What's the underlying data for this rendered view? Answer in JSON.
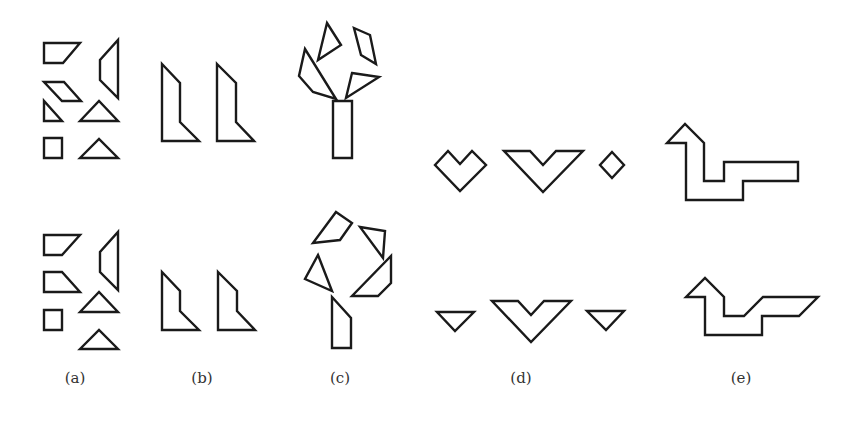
{
  "figure": {
    "stroke_color": "#1a1a1a",
    "background": "#ffffff",
    "panels": [
      {
        "id": "a",
        "label": "(a)",
        "label_x": 75,
        "description": "Loose tangram pieces (two sets)",
        "rows": {
          "top": [
            {
              "name": "trapezoid",
              "points": "44,43 80,43 63,63 44,63"
            },
            {
              "name": "right-trapezoid",
              "points": "118,40 118,98 100,80 100,60"
            },
            {
              "name": "parallelogram",
              "points": "44,82 64,82 81,101 62,101"
            },
            {
              "name": "small-triangle",
              "points": "44,101 44,121 62,121"
            },
            {
              "name": "triangle",
              "points": "80,121 99,101 118,121"
            },
            {
              "name": "square",
              "points": "44,138 62,138 62,158 44,158"
            },
            {
              "name": "triangle",
              "points": "80,158 99,139 118,158"
            }
          ],
          "bottom": [
            {
              "name": "trapezoid",
              "points": "44,235 80,235 62,255 44,255"
            },
            {
              "name": "right-trapezoid",
              "points": "118,232 118,290 100,272 100,252"
            },
            {
              "name": "trapezoid",
              "points": "44,272 62,272 80,292 44,292"
            },
            {
              "name": "triangle",
              "points": "80,312 99,292 118,312"
            },
            {
              "name": "square",
              "points": "44,310 62,310 62,330 44,330"
            },
            {
              "name": "triangle",
              "points": "80,349 99,330 118,349"
            }
          ]
        }
      },
      {
        "id": "b",
        "label": "(b)",
        "label_x": 202,
        "description": "Boot-like composite shapes",
        "rows": {
          "top": [
            {
              "name": "boot-shape",
              "points": "162,64 180,83 180,122 199,141 162,141"
            },
            {
              "name": "boot-shape",
              "points": "217,64 236,83 236,122 254,141 217,141"
            }
          ],
          "bottom": [
            {
              "name": "boot-shape",
              "points": "162,272 180,291 180,311 199,330 162,330"
            },
            {
              "name": "boot-shape",
              "points": "218,272 237,291 237,311 255,330 218,330"
            }
          ]
        }
      },
      {
        "id": "c",
        "label": "(c)",
        "label_x": 340,
        "description": "Tree-like arrangements",
        "rows": {
          "top": [
            {
              "name": "trunk-rectangle",
              "points": "333,101 352,101 352,158 333,158"
            },
            {
              "name": "triangle-branch",
              "points": "327,23 341,45 318,60"
            },
            {
              "name": "parallelogram-branch",
              "points": "354,28 370,35 376,64 361,55"
            },
            {
              "name": "trapezoid-branch",
              "points": "305,49 336,99 313,92 299,76"
            },
            {
              "name": "triangle-branch",
              "points": "352,73 379,77 346,98"
            }
          ],
          "bottom": [
            {
              "name": "trunk-pentagon",
              "points": "332,297 351,318 351,348 332,348"
            },
            {
              "name": "quad-branch",
              "points": "336,212 352,223 340,240 313,243"
            },
            {
              "name": "triangle-branch",
              "points": "360,227 385,231 383,258"
            },
            {
              "name": "triangle-branch",
              "points": "318,255 332,291 305,279"
            },
            {
              "name": "trapezoid-branch",
              "points": "391,256 391,283 378,296 352,296"
            }
          ]
        }
      },
      {
        "id": "d",
        "label": "(d)",
        "label_x": 521,
        "description": "Heart, chevron and diamond shapes",
        "rows": {
          "top": [
            {
              "name": "heart-shape",
              "points": "435,165 448,151 460,164 472,151 486,165 460,191"
            },
            {
              "name": "chevron-shape",
              "points": "504,151 530,151 543,165 556,151 583,151 543,192"
            },
            {
              "name": "diamond",
              "points": "612,152 624,165 612,178 600,165"
            }
          ],
          "bottom": [
            {
              "name": "inverted-triangle",
              "points": "437,312 474,312 455,331"
            },
            {
              "name": "chevron-shape",
              "points": "492,301 518,301 531,315 544,301 571,301 531,342"
            },
            {
              "name": "inverted-triangle",
              "points": "587,311 624,311 606,330"
            }
          ]
        }
      },
      {
        "id": "e",
        "label": "(e)",
        "label_x": 741,
        "description": "Stair-step arrow composites",
        "rows": {
          "top": [
            {
              "name": "stair-arrow",
              "points": "667,143 685,124 704,143 704,181 724,181 724,162 798,162 798,181 743,181 743,200 686,200 686,143"
            }
          ],
          "bottom": [
            {
              "name": "stair-arrow",
              "points": "686,297 705,278 724,297 724,316 744,316 763,297 818,297 799,316 762,316 762,335 705,335 705,297"
            }
          ]
        }
      }
    ]
  }
}
